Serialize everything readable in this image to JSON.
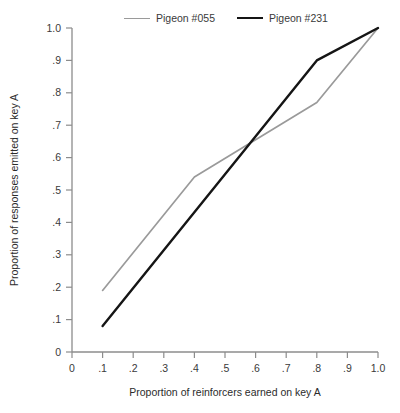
{
  "chart_data": {
    "type": "line",
    "title": "",
    "xlabel": "Proportion of reinforcers earned on key A",
    "ylabel": "Proportion of responses emitted on key A",
    "xlim": [
      0,
      1.0
    ],
    "ylim": [
      0,
      1.0
    ],
    "grid": false,
    "legend_position": "top",
    "x_tick_labels": [
      "0",
      ".1",
      ".2",
      ".3",
      ".4",
      ".5",
      ".6",
      ".7",
      ".8",
      ".9",
      "1.0"
    ],
    "x_tick_values": [
      0,
      0.1,
      0.2,
      0.3,
      0.4,
      0.5,
      0.6,
      0.7,
      0.8,
      0.9,
      1.0
    ],
    "y_tick_labels": [
      "0",
      ".1",
      ".2",
      ".3",
      ".4",
      ".5",
      ".6",
      ".7",
      ".8",
      ".9",
      "1.0"
    ],
    "y_tick_values": [
      0,
      0.1,
      0.2,
      0.3,
      0.4,
      0.5,
      0.6,
      0.7,
      0.8,
      0.9,
      1.0
    ],
    "series": [
      {
        "name": "Pigeon #055",
        "color": "#9a9a9a",
        "x": [
          0.1,
          0.4,
          0.8,
          1.0
        ],
        "values": [
          0.19,
          0.54,
          0.77,
          1.0
        ]
      },
      {
        "name": "Pigeon #231",
        "color": "#151515",
        "x": [
          0.1,
          0.8,
          1.0
        ],
        "values": [
          0.08,
          0.9,
          1.0
        ]
      }
    ]
  },
  "legend": {
    "entries": [
      {
        "label": "Pigeon #055",
        "swatch": "gray-line-swatch"
      },
      {
        "label": "Pigeon #231",
        "swatch": "black-line-swatch"
      }
    ]
  },
  "axes": {
    "x_title": "Proportion of reinforcers earned on key A",
    "y_title": "Proportion of responses emitted on key A"
  }
}
